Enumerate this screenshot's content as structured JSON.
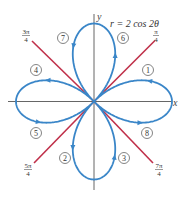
{
  "figure": {
    "equation_label": "r = 2 cos 2θ",
    "axis_labels": {
      "x": "x",
      "y": "y"
    },
    "colors": {
      "curve": "#3a86c8",
      "lines": "#c0304a",
      "axes": "#555555",
      "text": "#333333"
    },
    "angle_labels": [
      {
        "id": "pi_4",
        "num": "π",
        "den": "4"
      },
      {
        "id": "3pi_4",
        "num": "3π",
        "den": "4"
      },
      {
        "id": "5pi_4",
        "num": "5π",
        "den": "4"
      },
      {
        "id": "7pi_4",
        "num": "7π",
        "den": "4"
      }
    ],
    "loop_order_labels": [
      "1",
      "2",
      "3",
      "4",
      "5",
      "6",
      "7",
      "8"
    ]
  },
  "chart_data": {
    "type": "polar-curve",
    "title": "r = 2 cos 2θ",
    "curve": "four-leaved rose",
    "equation": "r = 2 cos 2θ",
    "amplitude": 2,
    "leaves": 4,
    "leaf_directions": [
      "0",
      "π/2",
      "π",
      "3π/2"
    ],
    "boundary_lines": [
      "π/4",
      "3π/4",
      "5π/4",
      "7π/4"
    ],
    "traversal_order": [
      {
        "label": "1",
        "theta_range": "0 to π/4",
        "position": "right upper half"
      },
      {
        "label": "2",
        "theta_range": "π/4 to π/2",
        "position": "bottom left half"
      },
      {
        "label": "3",
        "theta_range": "π/2 to 3π/4",
        "position": "bottom right half"
      },
      {
        "label": "4",
        "theta_range": "3π/4 to π",
        "position": "left upper half"
      },
      {
        "label": "5",
        "theta_range": "π to 5π/4",
        "position": "left lower half"
      },
      {
        "label": "6",
        "theta_range": "5π/4 to 3π/2",
        "position": "top right half"
      },
      {
        "label": "7",
        "theta_range": "3π/2 to 7π/4",
        "position": "top left half"
      },
      {
        "label": "8",
        "theta_range": "7π/4 to 2π",
        "position": "right lower half"
      }
    ],
    "xlabel": "x",
    "ylabel": "y",
    "grid": false
  }
}
